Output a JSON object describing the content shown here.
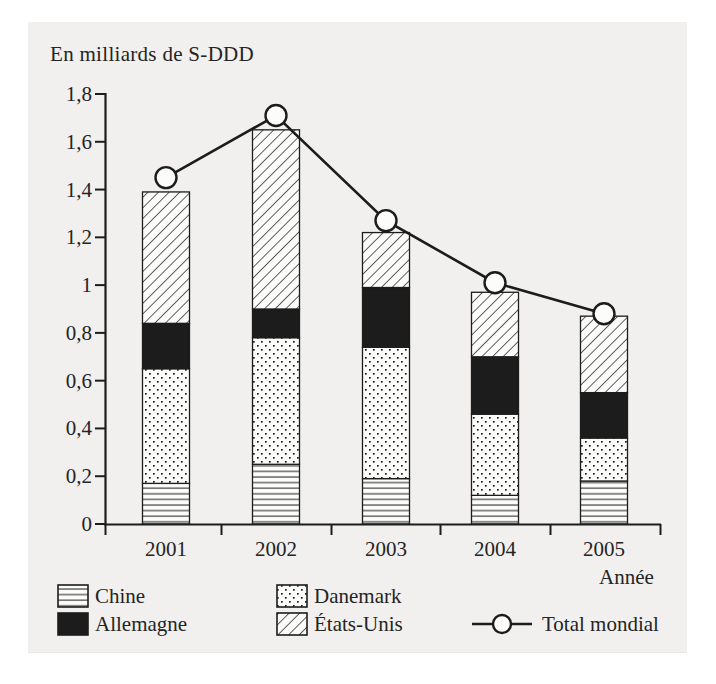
{
  "page": {
    "paper_color": "#f1f0ee",
    "ink_color": "#1c1c1c",
    "bar_background_color": "#fcfcfb"
  },
  "chart_data": {
    "type": "bar",
    "stacked": true,
    "unit_label": "En milliards de S-DDD",
    "xlabel": "Année",
    "categories": [
      "2001",
      "2002",
      "2003",
      "2004",
      "2005"
    ],
    "series": [
      {
        "name": "Chine",
        "key": "chine",
        "pattern": "hlines",
        "values": [
          0.17,
          0.25,
          0.19,
          0.12,
          0.18
        ]
      },
      {
        "name": "Danemark",
        "key": "danemark",
        "pattern": "dots",
        "values": [
          0.48,
          0.53,
          0.55,
          0.34,
          0.18
        ]
      },
      {
        "name": "Allemagne",
        "key": "allemagne",
        "pattern": "solid",
        "values": [
          0.19,
          0.12,
          0.25,
          0.24,
          0.19
        ]
      },
      {
        "name": "États-Unis",
        "key": "etats-unis",
        "pattern": "diag",
        "values": [
          0.55,
          0.75,
          0.23,
          0.27,
          0.32
        ]
      }
    ],
    "line_series": {
      "name": "Total mondial",
      "key": "total-mondial",
      "values": [
        1.45,
        1.71,
        1.27,
        1.01,
        0.88
      ]
    },
    "ylim": [
      0,
      1.8
    ],
    "ytick_step": 0.2,
    "ytick_labels": [
      "0",
      "0,2",
      "0,4",
      "0,6",
      "0,8",
      "1",
      "1,2",
      "1,4",
      "1,6",
      "1,8"
    ],
    "grid": false,
    "legend_position": "bottom"
  },
  "legend": {
    "entries": [
      {
        "label": "Chine",
        "key": "chine",
        "swatch": "hlines-pattern-swatch"
      },
      {
        "label": "Allemagne",
        "key": "allemagne",
        "swatch": "solid-black-swatch"
      },
      {
        "label": "Danemark",
        "key": "danemark",
        "swatch": "dots-pattern-swatch"
      },
      {
        "label": "États-Unis",
        "key": "etats-unis",
        "swatch": "diagonal-pattern-swatch"
      },
      {
        "label": "Total mondial",
        "key": "total-mondial",
        "swatch": "line-circle-marker"
      }
    ]
  }
}
